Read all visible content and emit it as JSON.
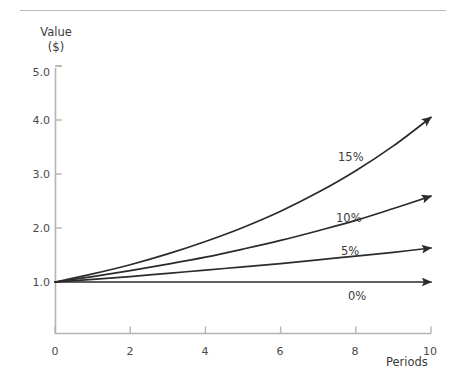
{
  "chart_data": {
    "type": "line",
    "title": "",
    "xlabel": "Periods",
    "ylabel": "Value ($)",
    "ylabel_line1": "Value",
    "ylabel_line2": "($)",
    "xlim": [
      0,
      10
    ],
    "ylim": [
      0,
      5
    ],
    "grid": false,
    "legend_position": "inline-annotations",
    "x": [
      0,
      1,
      2,
      3,
      4,
      5,
      6,
      7,
      8,
      9,
      10
    ],
    "xticks": [
      "0",
      "2",
      "4",
      "6",
      "8",
      "10"
    ],
    "xtick_values": [
      0,
      2,
      4,
      6,
      8,
      10
    ],
    "yticks": [
      "1.0",
      "2.0",
      "3.0",
      "4.0",
      "5.0"
    ],
    "ytick_values": [
      1,
      2,
      3,
      4,
      5
    ],
    "series": [
      {
        "name": "15%",
        "rate": 0.15,
        "values": [
          1.0,
          1.15,
          1.32,
          1.52,
          1.75,
          2.01,
          2.31,
          2.66,
          3.06,
          3.52,
          4.05
        ],
        "label_x": 7.1,
        "label_y": 3.25
      },
      {
        "name": "10%",
        "rate": 0.1,
        "values": [
          1.0,
          1.1,
          1.21,
          1.33,
          1.46,
          1.61,
          1.77,
          1.95,
          2.14,
          2.36,
          2.59
        ],
        "label_x": 7.0,
        "label_y": 2.3
      },
      {
        "name": "5%",
        "rate": 0.05,
        "values": [
          1.0,
          1.05,
          1.1,
          1.16,
          1.22,
          1.28,
          1.34,
          1.41,
          1.48,
          1.55,
          1.63
        ],
        "label_x": 7.1,
        "label_y": 1.7
      },
      {
        "name": "0%",
        "rate": 0.0,
        "values": [
          1.0,
          1.0,
          1.0,
          1.0,
          1.0,
          1.0,
          1.0,
          1.0,
          1.0,
          1.0,
          1.0
        ],
        "label_x": 7.2,
        "label_y": 0.85
      }
    ],
    "colors": {
      "curve": "#2b2b2b",
      "axis": "#b4b4b4",
      "text": "#3b3b3b",
      "rule": "#b9b9b9",
      "background": "#ffffff"
    }
  }
}
